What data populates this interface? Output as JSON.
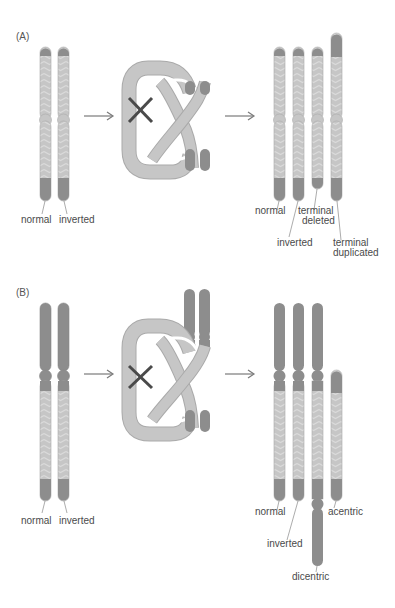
{
  "colors": {
    "background": "#ffffff",
    "dark_segment": "#8d8d8d",
    "light_segment": "#c4c4c4",
    "chevron": "#d6d6d6",
    "outline": "#a8a8a8",
    "crossover_mark": "#4a4a4a",
    "arrow": "#7a7a7a",
    "label_text": "#4a4a4a"
  },
  "panel_a": {
    "label": "(A)",
    "left_labels": {
      "normal": "normal",
      "inverted": "inverted"
    },
    "right_labels": {
      "normal": "normal",
      "inverted": "inverted",
      "terminal_deleted_1": "terminal",
      "terminal_deleted_2": "deleted",
      "terminal_duplicated_1": "terminal",
      "terminal_duplicated_2": "duplicated"
    }
  },
  "panel_b": {
    "label": "(B)",
    "left_labels": {
      "normal": "normal",
      "inverted": "inverted"
    },
    "right_labels": {
      "normal": "normal",
      "inverted": "inverted",
      "acentric": "acentric",
      "dicentric": "dicentric"
    }
  },
  "icons": {
    "crossover": "x-mark-icon",
    "arrow": "right-arrow-icon"
  }
}
